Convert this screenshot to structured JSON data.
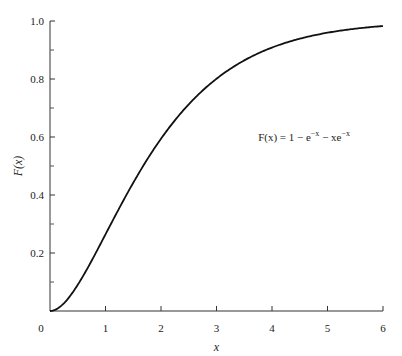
{
  "chart_data": {
    "type": "line",
    "title": "",
    "xlabel": "x",
    "ylabel": "F(x)",
    "xlim": [
      0,
      6
    ],
    "ylim": [
      0,
      1.0
    ],
    "grid": false,
    "x_ticks": [
      "0",
      "1",
      "2",
      "3",
      "4",
      "5",
      "6"
    ],
    "y_ticks": [
      "0",
      "0.2",
      "0.4",
      "0.6",
      "0.8",
      "1.0"
    ],
    "y_minor_ticks": [
      0.1,
      0.3,
      0.5,
      0.7,
      0.9
    ],
    "annotation": {
      "text_main": "F(x) = 1 − e",
      "sup1": "−x",
      "text_mid": " − xe",
      "sup2": "−x",
      "x": 3.75,
      "y": 0.6
    },
    "series": [
      {
        "name": "F(x) = 1 - e^-x - x e^-x",
        "x": [
          0,
          0.25,
          0.5,
          0.75,
          1.0,
          1.25,
          1.5,
          1.75,
          2.0,
          2.5,
          3.0,
          3.5,
          4.0,
          4.5,
          5.0,
          5.5,
          6.0
        ],
        "values": [
          0,
          0.026,
          0.09,
          0.173,
          0.264,
          0.355,
          0.442,
          0.522,
          0.594,
          0.713,
          0.801,
          0.864,
          0.908,
          0.939,
          0.96,
          0.973,
          0.983
        ]
      }
    ]
  }
}
